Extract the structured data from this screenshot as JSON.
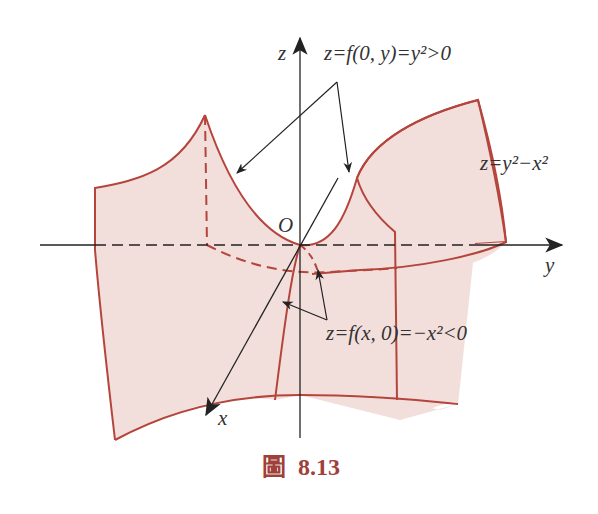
{
  "figure": {
    "caption_prefix": "圖",
    "caption_number": "8.13",
    "surface_equation": "z=y²−x²",
    "label_parabola_up": "z=f(0, y)=y²>0",
    "label_parabola_down": "z=f(x, 0)=−x²<0",
    "axes": {
      "z_label": "z",
      "y_label": "y",
      "x_label": "x",
      "origin_label": "O"
    }
  },
  "colors": {
    "surface_fill": "#f2dfdb",
    "surface_edge": "#b5453c",
    "axis": "#222222",
    "caption": "#a0403a"
  }
}
